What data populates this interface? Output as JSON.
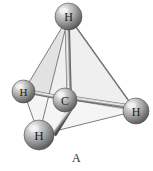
{
  "figure": {
    "caption": "A",
    "molecule_name": "methane",
    "formula": "CH4",
    "geometry": "tetrahedral",
    "background_color": "#ffffff",
    "style": "ball-and-stick with tetrahedron"
  },
  "atoms": [
    {
      "id": "h-top",
      "label": "H",
      "element": "H",
      "position": "top-vertex",
      "cx": 68.5,
      "cy": 16.5,
      "r": 13.5,
      "font_size": 12,
      "color_light": "#e9e9e9",
      "color_mid": "#9a9a9a",
      "color_dark": "#5a5a5a"
    },
    {
      "id": "h-left",
      "label": "H",
      "element": "H",
      "position": "left-vertex",
      "cx": 23.5,
      "cy": 91.5,
      "r": 11.5,
      "font_size": 11,
      "color_light": "#e9e9e9",
      "color_mid": "#9a9a9a",
      "color_dark": "#5a5a5a"
    },
    {
      "id": "h-right",
      "label": "H",
      "element": "H",
      "position": "right-vertex",
      "cx": 136.0,
      "cy": 111.0,
      "r": 13.0,
      "font_size": 12,
      "color_light": "#e9e9e9",
      "color_mid": "#9a9a9a",
      "color_dark": "#5a5a5a"
    },
    {
      "id": "h-bottom",
      "label": "H",
      "element": "H",
      "position": "bottom-vertex",
      "cx": 39.0,
      "cy": 135.0,
      "r": 15.0,
      "font_size": 13,
      "color_light": "#e9e9e9",
      "color_mid": "#9a9a9a",
      "color_dark": "#5a5a5a"
    },
    {
      "id": "c-center",
      "label": "C",
      "element": "C",
      "position": "center",
      "cx": 65.0,
      "cy": 100.0,
      "r": 12.0,
      "font_size": 12,
      "color_light": "#ececec",
      "color_mid": "#9d9d9d",
      "color_dark": "#5c5c5c"
    }
  ],
  "bonds": [
    {
      "id": "bond-c-h-top",
      "from": "c-center",
      "to": "h-top",
      "width": 5.0
    },
    {
      "id": "bond-c-h-left",
      "from": "c-center",
      "to": "h-left",
      "width": 4.5
    },
    {
      "id": "bond-c-h-right",
      "from": "c-center",
      "to": "h-right",
      "width": 4.5
    },
    {
      "id": "bond-c-h-bottom",
      "from": "c-center",
      "to": "h-bottom",
      "width": 5.0
    }
  ],
  "tetrahedron": {
    "vertices": {
      "top": [
        68.5,
        16.5
      ],
      "left": [
        23.5,
        91.5
      ],
      "right": [
        136.0,
        111.0
      ],
      "bottom": [
        39.0,
        135.0
      ]
    },
    "faces": [
      {
        "id": "face-top-left-bottom",
        "points": "68.5,16.5 23.5,91.5 39,135",
        "fill": "#e2e2e2",
        "opacity": 0.95
      },
      {
        "id": "face-top-bottom-right",
        "points": "68.5,16.5 39,135 136,111",
        "fill": "#efefef",
        "opacity": 0.95
      },
      {
        "id": "face-top-left-right",
        "points": "68.5,16.5 23.5,91.5 136,111",
        "fill": "#dcdcdc",
        "opacity": 0.55
      },
      {
        "id": "face-left-bottom-right",
        "points": "23.5,91.5 39,135 136,111",
        "fill": "#f4f4f4",
        "opacity": 0.9
      }
    ],
    "edge_color": "#6f6f6f",
    "edge_width": 0.9
  },
  "colors": {
    "background": "#ffffff",
    "atom_gray_light": "#e9e9e9",
    "atom_gray_mid": "#9a9a9a",
    "atom_gray_dark": "#5a5a5a",
    "bond_gray": "#8d8d8d",
    "face_gray": "#e6e6e6",
    "outline_gray": "#6f6f6f",
    "text_color": "#1a1a1a",
    "caption_color": "#2b2b2b"
  }
}
